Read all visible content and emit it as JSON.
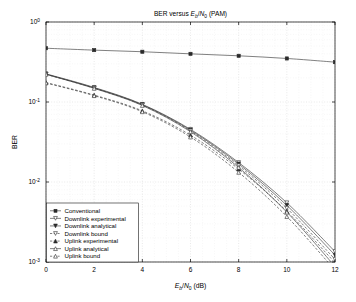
{
  "figure": {
    "title_parts": {
      "lead": "BER versus ",
      "e": "E",
      "b": "b",
      "slash": "/",
      "n": "N",
      "zero": "0",
      "trail": " (PAM)"
    },
    "title_plain": "BER versus Eb/N0 (PAM)",
    "background": "#ffffff",
    "line_color": "#3a3a3a",
    "grid_color": "#c8c8c8"
  },
  "chart_data": {
    "type": "line",
    "title": "BER versus Eb/N0 (PAM)",
    "xlabel": "Eb/N0 (dB)",
    "ylabel": "BER",
    "xlim": [
      0,
      12
    ],
    "ylim": [
      0.001,
      1
    ],
    "yscale": "log",
    "grid": true,
    "legend_position": "lower left",
    "x": [
      0,
      2,
      4,
      6,
      8,
      10,
      12
    ],
    "xticks": [
      0,
      2,
      4,
      6,
      8,
      10,
      12
    ],
    "xticklabels": [
      "0",
      "2",
      "4",
      "6",
      "8",
      "10",
      "12"
    ],
    "yticks": [
      1,
      0.1,
      0.01,
      0.001
    ],
    "yticklabels": [
      "10^0",
      "10^-1",
      "10^-2",
      "10^-3"
    ],
    "series": [
      {
        "name": "Conventional",
        "marker": "square",
        "fill": "filled",
        "style": "solid",
        "values": [
          0.47,
          0.445,
          0.425,
          0.4,
          0.378,
          0.35,
          0.315
        ]
      },
      {
        "name": "Downlink experimental",
        "marker": "triangle-down",
        "fill": "open",
        "style": "solid",
        "values": [
          0.225,
          0.152,
          0.0935,
          0.0455,
          0.0175,
          0.0055,
          0.00135
        ]
      },
      {
        "name": "Downlink analytical",
        "marker": "triangle-down",
        "fill": "filled",
        "style": "solid",
        "values": [
          0.223,
          0.15,
          0.0925,
          0.0445,
          0.0168,
          0.0051,
          0.00122
        ]
      },
      {
        "name": "Downlink bound",
        "marker": "triangle-down",
        "fill": "open",
        "style": "dashed",
        "values": [
          0.222,
          0.149,
          0.0915,
          0.0435,
          0.016,
          0.0047,
          0.00108
        ]
      },
      {
        "name": "Uplink experimental",
        "marker": "triangle-up",
        "fill": "filled",
        "style": "dashed",
        "values": [
          0.175,
          0.122,
          0.0775,
          0.0385,
          0.0145,
          0.0043,
          0.00098
        ]
      },
      {
        "name": "Uplink analytical",
        "marker": "triangle-up",
        "fill": "open",
        "style": "solid",
        "values": [
          0.222,
          0.148,
          0.0905,
          0.0425,
          0.0152,
          0.0042,
          0.00088
        ]
      },
      {
        "name": "Uplink bound",
        "marker": "triangle-up",
        "fill": "open",
        "style": "dashed",
        "values": [
          0.173,
          0.12,
          0.0755,
          0.0365,
          0.0132,
          0.0037,
          0.00079
        ]
      }
    ]
  },
  "legend": {
    "items": [
      {
        "label": "Conventional",
        "marker": "square",
        "fill": "filled",
        "style": "solid"
      },
      {
        "label": "Downlink experimental",
        "marker": "triangle-down",
        "fill": "open",
        "style": "solid"
      },
      {
        "label": "Downlink analytical",
        "marker": "triangle-down",
        "fill": "filled",
        "style": "solid"
      },
      {
        "label": "Downlink bound",
        "marker": "triangle-down",
        "fill": "open",
        "style": "dashed"
      },
      {
        "label": "Uplink experimental",
        "marker": "triangle-up",
        "fill": "filled",
        "style": "dashed"
      },
      {
        "label": "Uplink analytical",
        "marker": "triangle-up",
        "fill": "open",
        "style": "solid"
      },
      {
        "label": "Uplink bound",
        "marker": "triangle-up",
        "fill": "open",
        "style": "dashed"
      }
    ]
  },
  "axes": {
    "ylabel": "BER",
    "xlabel_parts": {
      "e": "E",
      "b": "b",
      "slash": "/",
      "n": "N",
      "zero": "0",
      "unit": " (dB)"
    },
    "xlabel_plain": "Eb/N0 (dB)"
  }
}
